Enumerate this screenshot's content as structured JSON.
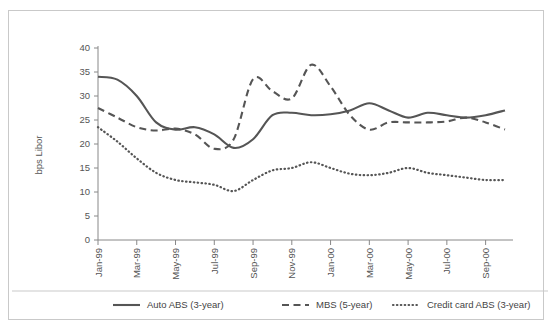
{
  "chart_data": {
    "type": "line",
    "title": "",
    "xlabel": "",
    "ylabel": "bps Libor",
    "ylim": [
      0,
      40
    ],
    "yticks": [
      0,
      5,
      10,
      15,
      20,
      25,
      30,
      35,
      40
    ],
    "grid": false,
    "legend_position": "bottom",
    "x": [
      "Jan-99",
      "Feb-99",
      "Mar-99",
      "Apr-99",
      "May-99",
      "Jun-99",
      "Jul-99",
      "Aug-99",
      "Sep-99",
      "Oct-99",
      "Nov-99",
      "Dec-99",
      "Jan-00",
      "Feb-00",
      "Mar-00",
      "Apr-00",
      "May-00",
      "Jun-00",
      "Jul-00",
      "Aug-00",
      "Sep-00",
      "Oct-00"
    ],
    "xtick_labels": [
      "Jan-99",
      "Mar-99",
      "May-99",
      "Jul-99",
      "Sep-99",
      "Nov-99",
      "Jan-00",
      "Mar-00",
      "May-00",
      "Jul-00",
      "Sep-00"
    ],
    "series": [
      {
        "name": "Auto ABS (3-year)",
        "style": "solid",
        "color": "#555555",
        "values": [
          34.0,
          33.4,
          30.0,
          24.5,
          23.0,
          23.5,
          22.0,
          19.2,
          21.0,
          26.0,
          26.5,
          26.0,
          26.2,
          27.0,
          28.5,
          27.0,
          25.5,
          26.5,
          26.0,
          25.5,
          26.0,
          27.0
        ]
      },
      {
        "name": "MBS (5-year)",
        "style": "dashed",
        "color": "#555555",
        "values": [
          27.5,
          25.5,
          23.5,
          22.8,
          23.2,
          22.0,
          19.0,
          21.0,
          33.5,
          31.0,
          29.5,
          36.5,
          32.0,
          26.0,
          23.0,
          24.5,
          24.5,
          24.5,
          24.7,
          25.5,
          24.5,
          23.0
        ]
      },
      {
        "name": "Credit card ABS (3-year)",
        "style": "dotted",
        "color": "#555555",
        "values": [
          23.5,
          20.5,
          17.0,
          14.0,
          12.5,
          12.0,
          11.5,
          10.2,
          12.5,
          14.5,
          15.0,
          16.2,
          15.0,
          13.8,
          13.5,
          14.0,
          15.0,
          14.0,
          13.5,
          13.0,
          12.5,
          12.5
        ]
      }
    ]
  },
  "legend": {
    "items": [
      {
        "label": "Auto ABS (3-year)",
        "style": "solid"
      },
      {
        "label": "MBS (5-year)",
        "style": "dashed"
      },
      {
        "label": "Credit card ABS (3-year)",
        "style": "dotted"
      }
    ]
  },
  "colors": {
    "line": "#555555",
    "axis": "#888888",
    "frame": "#c9c9c9",
    "text": "#555555",
    "background": "#ffffff"
  }
}
